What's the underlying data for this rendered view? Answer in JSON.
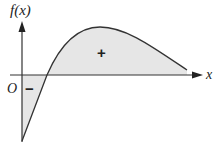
{
  "diagram": {
    "y_axis_label": "f(x)",
    "x_axis_label": "x",
    "origin_label": "O",
    "positive_region_label": "+",
    "negative_region_label": "−",
    "colors": {
      "curve": "#333333",
      "fill": "#e6e6e6",
      "axis": "#333333"
    }
  }
}
